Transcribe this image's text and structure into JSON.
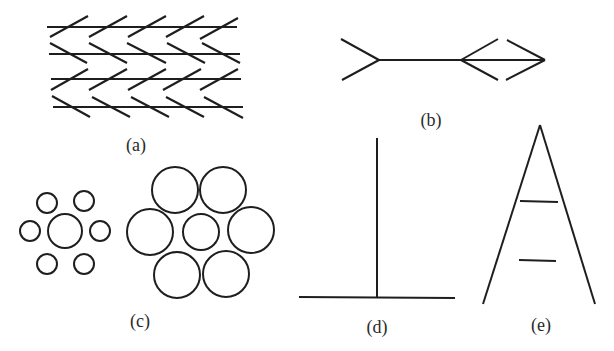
{
  "figure": {
    "width": 614,
    "height": 351,
    "stroke_color": "#1e1e1e",
    "background": "#ffffff"
  },
  "panels": [
    {
      "id": "a",
      "label": "(a)",
      "label_pos": [
        136,
        145
      ],
      "name": "zollner-illusion",
      "lines": [
        [
          47,
          27,
          237,
          27
        ],
        [
          49,
          54,
          240,
          54
        ],
        [
          51,
          79,
          241,
          79
        ],
        [
          53,
          107,
          243,
          107
        ],
        [
          50,
          37,
          88,
          16
        ],
        [
          89,
          37,
          127,
          16
        ],
        [
          128,
          37,
          166,
          16
        ],
        [
          166,
          37,
          204,
          16
        ],
        [
          200,
          39,
          238,
          18
        ],
        [
          50,
          43,
          87,
          63
        ],
        [
          89,
          43,
          127,
          63
        ],
        [
          127,
          43,
          166,
          63
        ],
        [
          167,
          43,
          205,
          63
        ],
        [
          202,
          43,
          240,
          63
        ],
        [
          51,
          90,
          88,
          69
        ],
        [
          89,
          90,
          127,
          69
        ],
        [
          128,
          90,
          166,
          69
        ],
        [
          163,
          90,
          201,
          69
        ],
        [
          200,
          90,
          238,
          69
        ],
        [
          52,
          96,
          90,
          117
        ],
        [
          92,
          97,
          130,
          117
        ],
        [
          131,
          97,
          169,
          117
        ],
        [
          166,
          97,
          204,
          117
        ],
        [
          204,
          97,
          243,
          118
        ]
      ],
      "stroke_width": 2.2
    },
    {
      "id": "b",
      "label": "(b)",
      "label_pos": [
        431,
        120
      ],
      "name": "muller-lyer-illusion",
      "lines": [
        [
          341,
          39,
          379,
          60
        ],
        [
          342,
          80,
          379,
          60
        ],
        [
          379,
          60,
          545,
          60
        ],
        [
          461,
          60,
          498,
          39
        ],
        [
          461,
          60,
          498,
          80
        ],
        [
          507,
          40,
          545,
          60
        ],
        [
          506,
          80,
          545,
          60
        ]
      ],
      "stroke_width": 2
    },
    {
      "id": "c",
      "label": "(c)",
      "label_pos": [
        140,
        321
      ],
      "name": "ebbinghaus-illusion",
      "circles": [
        [
          65,
          231,
          17
        ],
        [
          47,
          203,
          10
        ],
        [
          84,
          201,
          10
        ],
        [
          30,
          231,
          10
        ],
        [
          100,
          231,
          10
        ],
        [
          47,
          264,
          10
        ],
        [
          84,
          264,
          10
        ],
        [
          201,
          232,
          18
        ],
        [
          175,
          190,
          23
        ],
        [
          223,
          190,
          23
        ],
        [
          150,
          232,
          23
        ],
        [
          251,
          230,
          23
        ],
        [
          177,
          275,
          23
        ],
        [
          226,
          274,
          23
        ]
      ],
      "stroke_width": 2
    },
    {
      "id": "d",
      "label": "(d)",
      "label_pos": [
        377,
        327
      ],
      "name": "vertical-horizontal-illusion",
      "lines": [
        [
          377,
          138,
          377,
          297
        ],
        [
          299,
          297,
          455,
          298
        ]
      ],
      "stroke_width": 2
    },
    {
      "id": "e",
      "label": "(e)",
      "label_pos": [
        541,
        325
      ],
      "name": "ponzo-illusion",
      "lines": [
        [
          540,
          125,
          483,
          304
        ],
        [
          540,
          125,
          595,
          304
        ],
        [
          520,
          201,
          558,
          202
        ],
        [
          519,
          260,
          556,
          261
        ]
      ],
      "stroke_width": 2
    }
  ]
}
